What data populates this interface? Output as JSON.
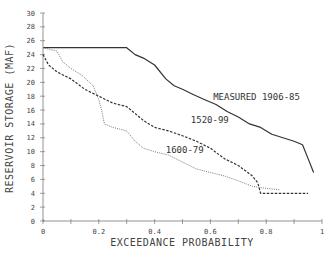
{
  "chart_data": {
    "type": "line",
    "title": "",
    "xlabel": "EXCEEDANCE PROBABILITY",
    "ylabel": "RESERVOIR STORAGE (MAF)",
    "xlim": [
      0,
      1
    ],
    "ylim": [
      0,
      30
    ],
    "xticks": [
      0,
      0.2,
      0.4,
      0.6,
      0.8,
      1
    ],
    "xtick_labels": [
      "0",
      "0.2",
      "0.4",
      "0.6",
      "0.8",
      "1"
    ],
    "yticks": [
      0,
      2,
      4,
      6,
      8,
      10,
      12,
      14,
      16,
      18,
      20,
      22,
      24,
      26,
      28,
      30
    ],
    "ytick_labels": [
      "0",
      "2",
      "4",
      "6",
      "8",
      "10",
      "12",
      "14",
      "16",
      "18",
      "20",
      "22",
      "24",
      "26",
      "28",
      "30"
    ],
    "grid": false,
    "legend": "inline annotations",
    "series": [
      {
        "name": "MEASURED 1906-85",
        "style": "solid",
        "x": [
          0,
          0.3,
          0.33,
          0.36,
          0.4,
          0.44,
          0.47,
          0.5,
          0.54,
          0.58,
          0.62,
          0.66,
          0.7,
          0.74,
          0.78,
          0.82,
          0.86,
          0.9,
          0.93,
          0.95,
          0.97
        ],
        "y": [
          25,
          25,
          24,
          23.5,
          22.5,
          20.5,
          19.5,
          19,
          18.2,
          17.5,
          16.8,
          15.8,
          15,
          14,
          13.5,
          12.5,
          12,
          11.5,
          11,
          9,
          7
        ]
      },
      {
        "name": "1520-99",
        "style": "dashed",
        "x": [
          0,
          0.02,
          0.05,
          0.1,
          0.15,
          0.2,
          0.25,
          0.3,
          0.33,
          0.36,
          0.4,
          0.45,
          0.5,
          0.55,
          0.6,
          0.65,
          0.7,
          0.75,
          0.77,
          0.78,
          0.85,
          0.95
        ],
        "y": [
          24,
          22.5,
          21.5,
          20.5,
          19,
          18,
          17,
          16.5,
          15.5,
          14.5,
          13.5,
          13,
          12.3,
          11.5,
          10.5,
          9,
          8,
          6.5,
          5.5,
          4,
          4,
          4
        ]
      },
      {
        "name": "1600-79",
        "style": "dotted",
        "x": [
          0,
          0.05,
          0.07,
          0.1,
          0.14,
          0.18,
          0.2,
          0.21,
          0.22,
          0.25,
          0.3,
          0.33,
          0.36,
          0.4,
          0.45,
          0.5,
          0.55,
          0.6,
          0.65,
          0.7,
          0.75,
          0.8,
          0.85
        ],
        "y": [
          25,
          24.5,
          23,
          22,
          21,
          19.5,
          17.5,
          16,
          14,
          13.5,
          13,
          11.5,
          10.5,
          10,
          9.5,
          8.5,
          7.5,
          7,
          6.5,
          5.8,
          5,
          4.7,
          4.5
        ]
      }
    ],
    "annotations": [
      {
        "text": "MEASURED 1906-85",
        "x": 0.61,
        "y": 17.5
      },
      {
        "text": "1520-99",
        "x": 0.53,
        "y": 14.1
      },
      {
        "text": "1600-79",
        "x": 0.44,
        "y": 9.8
      }
    ]
  }
}
